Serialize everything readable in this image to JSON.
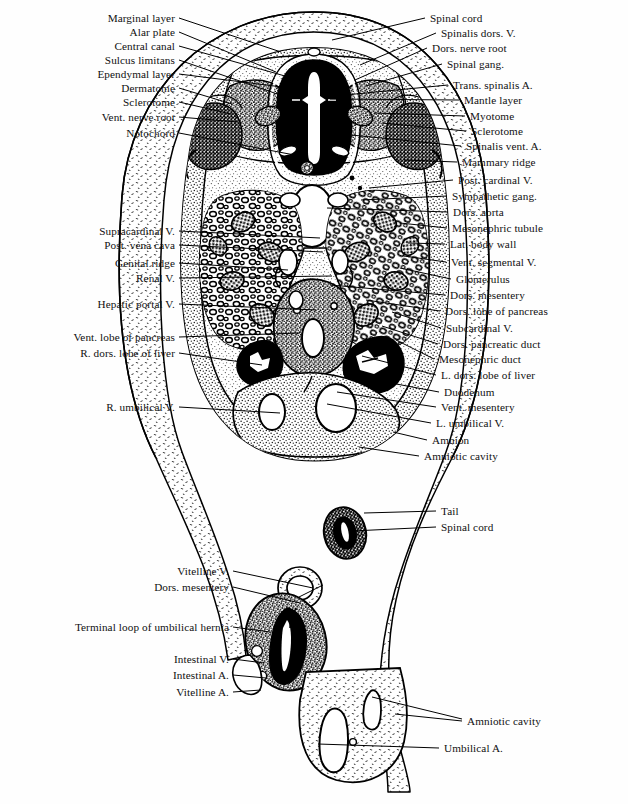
{
  "figure": {
    "ink_color": "#000000",
    "paper_color": "#ffffff",
    "stipple_color": "#3a3a3a"
  },
  "labels_left": [
    {
      "text": "Marginal layer",
      "x": 175,
      "y": 18,
      "tx": 281,
      "ty": 52
    },
    {
      "text": "Alar plate",
      "x": 175,
      "y": 32,
      "tx": 276,
      "ty": 72
    },
    {
      "text": "Central canal",
      "x": 175,
      "y": 46,
      "tx": 292,
      "ty": 78
    },
    {
      "text": "Sulcus limitans",
      "x": 175,
      "y": 60,
      "tx": 283,
      "ty": 96
    },
    {
      "text": "Ependymal layer",
      "x": 175,
      "y": 74,
      "tx": 290,
      "ty": 88
    },
    {
      "text": "Dermatome",
      "x": 175,
      "y": 88,
      "tx": 232,
      "ty": 104
    },
    {
      "text": "Sclerotome",
      "x": 175,
      "y": 102,
      "tx": 231,
      "ty": 114
    },
    {
      "text": "Vent. nerve root",
      "x": 175,
      "y": 117,
      "tx": 238,
      "ty": 122
    },
    {
      "text": "Notochord",
      "x": 175,
      "y": 133,
      "tx": 305,
      "ty": 157
    },
    {
      "text": "Supracardinal V.",
      "x": 175,
      "y": 231,
      "tx": 320,
      "ty": 238
    },
    {
      "text": "Post. vena cava",
      "x": 175,
      "y": 245,
      "tx": 323,
      "ty": 252
    },
    {
      "text": "Genital ridge",
      "x": 175,
      "y": 263,
      "tx": 288,
      "ty": 270
    },
    {
      "text": "Renal V.",
      "x": 175,
      "y": 278,
      "tx": 332,
      "ty": 276
    },
    {
      "text": "Hepatic portal V.",
      "x": 175,
      "y": 304,
      "tx": 316,
      "ty": 310
    },
    {
      "text": "Vent. lobe of pancreas",
      "x": 175,
      "y": 337,
      "tx": 300,
      "ty": 333
    },
    {
      "text": "R. dors. lobe of liver",
      "x": 175,
      "y": 353,
      "tx": 262,
      "ty": 365
    },
    {
      "text": "R. umbilical V.",
      "x": 175,
      "y": 407,
      "tx": 280,
      "ty": 413
    },
    {
      "text": "Vitelline V.",
      "x": 229,
      "y": 571,
      "tx": 313,
      "ty": 588
    },
    {
      "text": "Dors. mesentery",
      "x": 229,
      "y": 587,
      "tx": 300,
      "ty": 603
    },
    {
      "text": "Terminal loop of umbilical hernia",
      "x": 229,
      "y": 627,
      "tx": 270,
      "ty": 632
    },
    {
      "text": "Intestinal V.",
      "x": 229,
      "y": 659,
      "tx": 264,
      "ty": 663
    },
    {
      "text": "Intestinal A.",
      "x": 229,
      "y": 675,
      "tx": 266,
      "ty": 678
    },
    {
      "text": "Vitelline A.",
      "x": 229,
      "y": 692,
      "tx": 261,
      "ty": 690
    }
  ],
  "labels_right": [
    {
      "text": "Spinal cord",
      "x": 430,
      "y": 18,
      "tx": 332,
      "ty": 40
    },
    {
      "text": "Spinalis dors. V.",
      "x": 441,
      "y": 33,
      "tx": 360,
      "ty": 65
    },
    {
      "text": "Dors. nerve root",
      "x": 432,
      "y": 48,
      "tx": 355,
      "ty": 80
    },
    {
      "text": "Spinal gang.",
      "x": 447,
      "y": 64,
      "tx": 366,
      "ty": 86
    },
    {
      "text": "Trans. spinalis A.",
      "x": 453,
      "y": 85,
      "tx": 345,
      "ty": 95
    },
    {
      "text": "Mantle layer",
      "x": 464,
      "y": 100,
      "tx": 330,
      "ty": 99
    },
    {
      "text": "Myotome",
      "x": 470,
      "y": 116,
      "tx": 374,
      "ty": 113
    },
    {
      "text": "Sclerotome",
      "x": 471,
      "y": 131,
      "tx": 382,
      "ty": 123
    },
    {
      "text": "Spinalis vent. A.",
      "x": 466,
      "y": 146,
      "tx": 351,
      "ty": 135
    },
    {
      "text": "Mammary ridge",
      "x": 462,
      "y": 162,
      "tx": 404,
      "ty": 160
    },
    {
      "text": "Post. cardinal V.",
      "x": 458,
      "y": 180,
      "tx": 369,
      "ty": 188
    },
    {
      "text": "Sympathetic gang.",
      "x": 452,
      "y": 196,
      "tx": 361,
      "ty": 200
    },
    {
      "text": "Dors. aorta",
      "x": 453,
      "y": 212,
      "tx": 327,
      "ty": 208
    },
    {
      "text": "Mesonephric tubule",
      "x": 452,
      "y": 228,
      "tx": 400,
      "ty": 223
    },
    {
      "text": "Lat. body wall",
      "x": 450,
      "y": 244,
      "tx": 408,
      "ty": 243
    },
    {
      "text": "Vent. segmental V.",
      "x": 451,
      "y": 262,
      "tx": 404,
      "ty": 256
    },
    {
      "text": "Glomerulus",
      "x": 456,
      "y": 279,
      "tx": 400,
      "ty": 268
    },
    {
      "text": "Dors. mesentery",
      "x": 450,
      "y": 295,
      "tx": 330,
      "ty": 285
    },
    {
      "text": "Dors. lobe of pancreas",
      "x": 445,
      "y": 311,
      "tx": 366,
      "ty": 300
    },
    {
      "text": "Subcardinal V.",
      "x": 446,
      "y": 328,
      "tx": 392,
      "ty": 312
    },
    {
      "text": "Dors. pancreatic duct",
      "x": 443,
      "y": 344,
      "tx": 382,
      "ty": 326
    },
    {
      "text": "Mesonephric duct",
      "x": 439,
      "y": 359,
      "tx": 396,
      "ty": 340
    },
    {
      "text": "L. dors. lobe of liver",
      "x": 441,
      "y": 375,
      "tx": 362,
      "ty": 356
    },
    {
      "text": "Duodenum",
      "x": 444,
      "y": 392,
      "tx": 343,
      "ty": 374
    },
    {
      "text": "Vent. mesentery",
      "x": 441,
      "y": 407,
      "tx": 337,
      "ty": 392
    },
    {
      "text": "L. umbilical V.",
      "x": 436,
      "y": 423,
      "tx": 327,
      "ty": 404
    },
    {
      "text": "Amnion",
      "x": 432,
      "y": 440,
      "tx": 393,
      "ty": 432
    },
    {
      "text": "Amniotic cavity",
      "x": 424,
      "y": 456,
      "tx": 359,
      "ty": 447
    },
    {
      "text": "Tail",
      "x": 441,
      "y": 511,
      "tx": 364,
      "ty": 513
    },
    {
      "text": "Spinal cord",
      "x": 441,
      "y": 527,
      "tx": 352,
      "ty": 531
    },
    {
      "text": "Amniotic cavity",
      "x": 467,
      "y": 721,
      "tx": 395,
      "ty": 714
    },
    {
      "text": "Umbilical A.",
      "x": 444,
      "y": 748,
      "tx": 318,
      "ty": 744
    }
  ],
  "extra_leaders": [
    {
      "from_x": 462,
      "from_y": 719,
      "to_x": 372,
      "to_y": 697
    },
    {
      "from_x": 323,
      "from_y": 585,
      "to_x": 299,
      "to_y": 597
    }
  ],
  "structures": {
    "spinal_cord": "dark neural tube with white central canal",
    "notochord": "small ringed body ventral to neural tube",
    "dorsal_aorta": "large white oval in midline",
    "mesonephros": "paired masses of tubules and glomeruli",
    "liver_lobes": "dark stippled lobes flanking the gut",
    "umbilical_veins": "paired white ovals in ventral body wall",
    "amnion": "thin membrane enclosing the embryo",
    "tail": "separate dark oval section with spinal cord",
    "umbilical_hernia": "intestinal loop outside body wall",
    "umbilical_cord": "stippled cord containing umbilical artery"
  }
}
